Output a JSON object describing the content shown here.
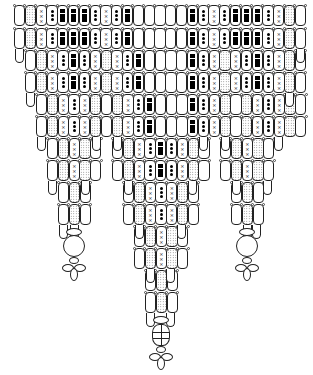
{
  "legend": {
    "E": "plain bead",
    "D": "dotted (stippled) bead",
    "X": "cross-marked bead",
    "O": "dot-marked bead",
    "B": "black-square bead"
  },
  "bead": {
    "width": 10.8,
    "height": 21,
    "row_pitch": 21.5
  },
  "rows": [
    {
      "y": 5,
      "segments": [
        {
          "x": 14,
          "beads": "EDXOBBBOXOBEEEEEBOXOBBBOXDE"
        }
      ]
    },
    {
      "y": 28,
      "segments": [
        {
          "x": 14,
          "beads": "EDXOBBBOXOBEEEEEBOXOBBBOXDE"
        }
      ]
    },
    {
      "y": 50,
      "segments": [
        {
          "x": 25,
          "beads": "EDXOBOXDXOBEEEEBOXDXOBOXDE"
        }
      ]
    },
    {
      "y": 72,
      "segments": [
        {
          "x": 25,
          "beads": "EDXOBOXDXOBEEEEBOXDXOBOXDE"
        }
      ]
    },
    {
      "y": 94,
      "segments": [
        {
          "x": 36,
          "beads": "EDXOXDEDXOBEEEBOXDEDXOXDE"
        }
      ]
    },
    {
      "y": 116,
      "segments": [
        {
          "x": 36,
          "beads": "EDXOXDEDXOBEEEBOXDEDXOXDE"
        }
      ]
    },
    {
      "y": 138,
      "segments": [
        {
          "x": 47,
          "beads": "EDXDE"
        },
        {
          "x": 112,
          "beads": "EDXOBOXDE"
        },
        {
          "x": 220,
          "beads": "EDXDE"
        }
      ]
    },
    {
      "y": 160,
      "segments": [
        {
          "x": 47,
          "beads": "EDXDE"
        },
        {
          "x": 112,
          "beads": "EDXOBOXDE"
        },
        {
          "x": 220,
          "beads": "EDXDE"
        }
      ]
    },
    {
      "y": 182,
      "segments": [
        {
          "x": 58,
          "beads": "EDE"
        },
        {
          "x": 123,
          "beads": "EDXOXDE"
        },
        {
          "x": 231,
          "beads": "EDE"
        }
      ]
    },
    {
      "y": 204,
      "segments": [
        {
          "x": 58,
          "beads": "EDE"
        },
        {
          "x": 123,
          "beads": "EDXOXDE"
        },
        {
          "x": 231,
          "beads": "EDE"
        }
      ]
    },
    {
      "y": 226,
      "segments": [
        {
          "x": 134,
          "beads": "EDXDE"
        }
      ]
    },
    {
      "y": 248,
      "segments": [
        {
          "x": 134,
          "beads": "EDXDE"
        }
      ]
    },
    {
      "y": 270,
      "segments": [
        {
          "x": 145,
          "beads": "EDE"
        }
      ]
    },
    {
      "y": 292,
      "segments": [
        {
          "x": 145,
          "beads": "EDE"
        }
      ]
    }
  ],
  "drops": [
    {
      "x": 16,
      "y": 50
    },
    {
      "x": 297,
      "y": 50
    },
    {
      "x": 27,
      "y": 94
    },
    {
      "x": 286,
      "y": 94
    },
    {
      "x": 38,
      "y": 138
    },
    {
      "x": 93,
      "y": 138
    },
    {
      "x": 114,
      "y": 138
    },
    {
      "x": 200,
      "y": 138
    },
    {
      "x": 222,
      "y": 138
    },
    {
      "x": 275,
      "y": 138
    },
    {
      "x": 49,
      "y": 182
    },
    {
      "x": 82,
      "y": 182
    },
    {
      "x": 125,
      "y": 182
    },
    {
      "x": 189,
      "y": 182
    },
    {
      "x": 233,
      "y": 182
    },
    {
      "x": 264,
      "y": 182
    },
    {
      "x": 60,
      "y": 226
    },
    {
      "x": 71,
      "y": 226
    },
    {
      "x": 136,
      "y": 226
    },
    {
      "x": 178,
      "y": 226
    },
    {
      "x": 244,
      "y": 226
    },
    {
      "x": 253,
      "y": 226
    },
    {
      "x": 147,
      "y": 270
    },
    {
      "x": 167,
      "y": 270
    },
    {
      "x": 147,
      "y": 314
    },
    {
      "x": 167,
      "y": 314
    }
  ],
  "pendants": [
    {
      "name": "left-pendant",
      "cx": 74,
      "top": 226,
      "bead": "round"
    },
    {
      "name": "center-pendant",
      "cx": 161,
      "top": 314,
      "bead": "faceted"
    },
    {
      "name": "right-pendant",
      "cx": 247,
      "top": 226,
      "bead": "round"
    }
  ]
}
